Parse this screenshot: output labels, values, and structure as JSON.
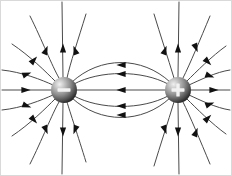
{
  "figure": {
    "background_color": "#ffffff",
    "frame_color": "#d9d9d9",
    "width": 232,
    "height": 176,
    "caption": ""
  },
  "charges": [
    {
      "id": "negative-charge",
      "label": "−",
      "sign": "negative",
      "cx": 64,
      "cy": 90,
      "r": 13,
      "body_color": "#6b6b6b",
      "highlight_color": "#e8e8e8",
      "shadow_color": "#1c1c1c",
      "sign_color": "#f2f2f2"
    },
    {
      "id": "positive-charge",
      "label": "+",
      "sign": "positive",
      "cx": 178,
      "cy": 90,
      "r": 13,
      "body_color": "#6b6b6b",
      "highlight_color": "#e8e8e8",
      "shadow_color": "#1c1c1c",
      "sign_color": "#f2f2f2"
    }
  ],
  "field": {
    "line_color": "#4a4a4a",
    "line_width": 1,
    "arrow_color": "#111111",
    "arrow_count": 34,
    "line_count": 22,
    "direction_note": "Arrows point away from the positive charge and toward the negative charge"
  },
  "chart_data": {
    "type": "line",
    "xlabel": "",
    "ylabel": "",
    "xlim": [
      0,
      232
    ],
    "ylim": [
      0,
      176
    ],
    "grid": false,
    "legend": "none",
    "annotations": [
      "−",
      "+"
    ],
    "series": [
      {
        "name": "dipole-arc-upper-1",
        "path": "M 72 82 C 100 56, 142 56, 170 82",
        "arrows": [
          {
            "x": 121,
            "y": 65,
            "angle": 180
          }
        ]
      },
      {
        "name": "dipole-arc-upper-2",
        "path": "M 74 84 C 100 70, 142 70, 168 84",
        "arrows": [
          {
            "x": 121,
            "y": 74,
            "angle": 180
          }
        ]
      },
      {
        "name": "dipole-axis-center",
        "path": "M 77 90 L 165 90",
        "arrows": [
          {
            "x": 121,
            "y": 90,
            "angle": 180
          }
        ]
      },
      {
        "name": "dipole-arc-lower-2",
        "path": "M 74 96 C 100 110, 142 110, 168 96",
        "arrows": [
          {
            "x": 121,
            "y": 106,
            "angle": 180
          }
        ]
      },
      {
        "name": "dipole-arc-lower-1",
        "path": "M 72 98 C 100 124, 142 124, 170 98",
        "arrows": [
          {
            "x": 121,
            "y": 115,
            "angle": 180
          }
        ]
      },
      {
        "name": "neg-axis-left",
        "path": "M 2 90 L 51 90",
        "arrows": [
          {
            "x": 26,
            "y": 90,
            "angle": 0
          }
        ]
      },
      {
        "name": "neg-ray-upleft-shallow",
        "path": "M 2 70 C 22 72, 42 80, 53 85",
        "arrows": [
          {
            "x": 27,
            "y": 74,
            "angle": 20
          }
        ]
      },
      {
        "name": "neg-ray-upleft-steep",
        "path": "M 12 44 C 30 56, 46 72, 55 81",
        "arrows": [
          {
            "x": 34,
            "y": 60,
            "angle": 48
          }
        ]
      },
      {
        "name": "neg-ray-upleft-steeper",
        "path": "M 30 16 C 42 40, 52 66, 59 78",
        "arrows": [
          {
            "x": 46,
            "y": 50,
            "angle": 68
          }
        ]
      },
      {
        "name": "neg-ray-up",
        "path": "M 62 2 L 63 77",
        "arrows": [
          {
            "x": 63,
            "y": 48,
            "angle": 90
          }
        ]
      },
      {
        "name": "neg-ray-upright",
        "path": "M 86 14 C 78 40, 70 64, 67 78",
        "arrows": [
          {
            "x": 75,
            "y": 50,
            "angle": 110
          }
        ]
      },
      {
        "name": "neg-ray-downleft-shallow",
        "path": "M 2 110 C 22 108, 42 100, 53 95",
        "arrows": [
          {
            "x": 27,
            "y": 106,
            "angle": -20
          }
        ]
      },
      {
        "name": "neg-ray-downleft-steep",
        "path": "M 12 136 C 30 124, 46 108, 55 99",
        "arrows": [
          {
            "x": 34,
            "y": 120,
            "angle": -48
          }
        ]
      },
      {
        "name": "neg-ray-downleft-steeper",
        "path": "M 30 164 C 42 140, 52 114, 59 102",
        "arrows": [
          {
            "x": 46,
            "y": 130,
            "angle": -68
          }
        ]
      },
      {
        "name": "neg-ray-down",
        "path": "M 62 174 L 63 103",
        "arrows": [
          {
            "x": 63,
            "y": 132,
            "angle": -90
          }
        ]
      },
      {
        "name": "neg-ray-downright",
        "path": "M 86 162 C 78 136, 70 112, 67 102",
        "arrows": [
          {
            "x": 75,
            "y": 130,
            "angle": -110
          }
        ]
      },
      {
        "name": "pos-axis-right",
        "path": "M 191 90 L 230 90",
        "arrows": [
          {
            "x": 214,
            "y": 90,
            "angle": 0
          }
        ]
      },
      {
        "name": "pos-ray-upright-shallow",
        "path": "M 189 85 C 200 80, 216 72, 230 70",
        "arrows": [
          {
            "x": 210,
            "y": 76,
            "angle": -20
          }
        ]
      },
      {
        "name": "pos-ray-upright-steep",
        "path": "M 187 81 C 196 72, 212 56, 226 46",
        "arrows": [
          {
            "x": 208,
            "y": 62,
            "angle": -45
          }
        ]
      },
      {
        "name": "pos-ray-upright-steeper",
        "path": "M 183 78 C 190 64, 200 40, 210 16",
        "arrows": [
          {
            "x": 196,
            "y": 48,
            "angle": -68
          }
        ]
      },
      {
        "name": "pos-ray-up",
        "path": "M 178 77 L 179 2",
        "arrows": [
          {
            "x": 178,
            "y": 48,
            "angle": 90
          }
        ]
      },
      {
        "name": "pos-ray-upleft",
        "path": "M 174 78 C 168 58, 160 34, 154 14",
        "arrows": [
          {
            "x": 165,
            "y": 50,
            "angle": 70
          }
        ]
      },
      {
        "name": "pos-ray-downright-shallow",
        "path": "M 189 95 C 200 100, 216 108, 230 110",
        "arrows": [
          {
            "x": 210,
            "y": 104,
            "angle": 20
          }
        ]
      },
      {
        "name": "pos-ray-downright-steep",
        "path": "M 187 99 C 196 108, 212 124, 226 134",
        "arrows": [
          {
            "x": 208,
            "y": 118,
            "angle": 45
          }
        ]
      },
      {
        "name": "pos-ray-downright-steeper",
        "path": "M 183 102 C 190 116, 200 140, 210 164",
        "arrows": [
          {
            "x": 196,
            "y": 132,
            "angle": 68
          }
        ]
      },
      {
        "name": "pos-ray-down",
        "path": "M 178 103 L 179 174",
        "arrows": [
          {
            "x": 178,
            "y": 132,
            "angle": -90
          }
        ]
      },
      {
        "name": "pos-ray-downleft",
        "path": "M 174 102 C 168 122, 160 146, 154 166",
        "arrows": [
          {
            "x": 165,
            "y": 130,
            "angle": -70
          }
        ]
      }
    ]
  }
}
